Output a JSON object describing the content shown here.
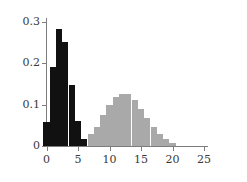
{
  "chart_data": {
    "type": "bar",
    "title": "",
    "subtitle": "",
    "xlabel": "",
    "ylabel": "",
    "xlim": [
      -1,
      25.8
    ],
    "ylim": [
      0,
      0.31
    ],
    "grid": false,
    "legend": null,
    "x_ticks": [
      "0",
      "5",
      "10",
      "15",
      "20",
      "25"
    ],
    "x_tick_values": [
      0,
      5,
      10,
      15,
      20,
      25
    ],
    "y_ticks": [
      "0",
      "0.1",
      "0.2",
      "0.3"
    ],
    "y_tick_values": [
      0,
      0.1,
      0.2,
      0.3
    ],
    "categories": [
      0,
      1,
      2,
      3,
      4,
      5,
      6,
      7,
      8,
      9,
      10,
      11,
      12,
      13,
      14,
      15,
      16,
      17,
      18,
      19,
      20
    ],
    "series": [
      {
        "name": "black-distribution",
        "color": "#111111",
        "x": [
          0,
          1,
          2,
          3,
          4,
          5,
          6
        ],
        "values": [
          0.057,
          0.19,
          0.283,
          0.25,
          0.147,
          0.06,
          0.017
        ]
      },
      {
        "name": "gray-distribution",
        "color": "#a9a9a9",
        "x": [
          7,
          8,
          9,
          10,
          11,
          12,
          13,
          14,
          15,
          16,
          17,
          18,
          19,
          20
        ],
        "values": [
          0.028,
          0.047,
          0.075,
          0.098,
          0.119,
          0.126,
          0.125,
          0.111,
          0.09,
          0.067,
          0.045,
          0.028,
          0.016,
          0.007
        ]
      }
    ]
  },
  "style": {
    "axis_color": "#7d7d7d",
    "tick_label_color": "#3a3a3a",
    "background": "#ffffff",
    "bar_width_px": 6.1
  }
}
